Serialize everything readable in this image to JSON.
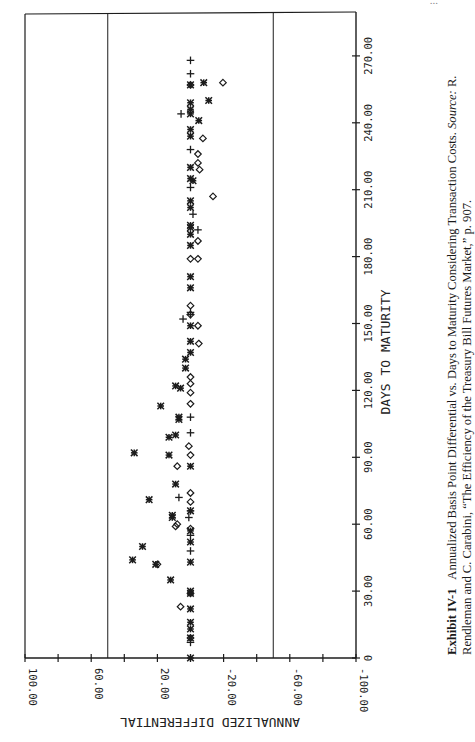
{
  "page": {
    "page_number_fragment": "..."
  },
  "caption": {
    "exhibit_label": "Exhibit IV-1",
    "text_1": "Annualized Basis Point Differential vs. Days to Maturity Considering Transaction Costs. ",
    "source_label": "Source:",
    "text_2": " R. Rendleman and C. Carabini, “The Efficiency of the Treasury Bill Futures Market,” p. 907."
  },
  "chart_data": {
    "type": "scatter",
    "title": "",
    "xlabel": "DAYS TO MATURITY",
    "ylabel": "ANNUALIZED DIFFERENTIAL",
    "xlim": [
      0,
      270
    ],
    "ylim": [
      -100,
      100
    ],
    "orientation": "rotated 90 degrees counter-clockwise on page",
    "x_ticks": [
      0,
      30,
      60,
      90,
      120,
      150,
      180,
      210,
      240,
      270
    ],
    "x_tick_labels": [
      "0",
      "30.00",
      "60.00",
      "90.00",
      "120.00",
      "150.00",
      "180.00",
      "210.00",
      "240.00",
      "270.00"
    ],
    "y_ticks": [
      100,
      80,
      60,
      40,
      20,
      0,
      -20,
      -40,
      -60,
      -80,
      -100
    ],
    "y_tick_labels": [
      "100.00",
      "",
      "60.00",
      "",
      "20.00",
      "",
      "-20.00",
      "",
      "-60.00",
      "",
      "-100.00"
    ],
    "reference_lines_y": [
      50,
      -50
    ],
    "grid": false,
    "legend": null,
    "series": [
      {
        "name": "star",
        "marker": "asterisk",
        "points": [
          [
            0,
            0
          ],
          [
            9,
            0
          ],
          [
            13,
            0
          ],
          [
            16,
            0
          ],
          [
            22,
            0
          ],
          [
            29,
            0
          ],
          [
            30,
            0
          ],
          [
            35,
            12
          ],
          [
            43,
            0
          ],
          [
            44,
            35
          ],
          [
            42,
            21
          ],
          [
            50,
            29
          ],
          [
            52,
            0
          ],
          [
            57,
            0
          ],
          [
            64,
            11
          ],
          [
            66,
            0
          ],
          [
            63,
            11
          ],
          [
            71,
            25
          ],
          [
            78,
            9
          ],
          [
            86,
            0
          ],
          [
            91,
            13
          ],
          [
            92,
            34
          ],
          [
            99,
            13
          ],
          [
            100,
            9
          ],
          [
            107,
            7
          ],
          [
            108,
            7
          ],
          [
            113,
            18
          ],
          [
            121,
            6
          ],
          [
            122,
            9
          ],
          [
            130,
            3
          ],
          [
            134,
            3
          ],
          [
            137,
            0
          ],
          [
            142,
            0
          ],
          [
            149,
            0
          ],
          [
            166,
            0
          ],
          [
            171,
            0
          ],
          [
            185,
            0
          ],
          [
            190,
            0
          ],
          [
            193,
            0
          ],
          [
            194,
            0
          ],
          [
            202,
            0
          ],
          [
            205,
            0
          ],
          [
            214,
            -1.5
          ],
          [
            215,
            0
          ],
          [
            220,
            0
          ],
          [
            234,
            0
          ],
          [
            237,
            0
          ],
          [
            241,
            -5
          ],
          [
            244,
            0
          ],
          [
            246,
            0
          ],
          [
            249,
            0
          ],
          [
            250,
            -11
          ],
          [
            257,
            0
          ],
          [
            258,
            -8
          ]
        ]
      },
      {
        "name": "plus",
        "marker": "plus",
        "points": [
          [
            7,
            0
          ],
          [
            48,
            0
          ],
          [
            55,
            0
          ],
          [
            63,
            1
          ],
          [
            66,
            0
          ],
          [
            72,
            7
          ],
          [
            101,
            0
          ],
          [
            108,
            0
          ],
          [
            152,
            4.5
          ],
          [
            154,
            0
          ],
          [
            155,
            0
          ],
          [
            192,
            -4.5
          ],
          [
            199,
            -1.5
          ],
          [
            211,
            0
          ],
          [
            228,
            0
          ],
          [
            244,
            5.7
          ],
          [
            262,
            0
          ],
          [
            268,
            0
          ]
        ]
      },
      {
        "name": "diamond",
        "marker": "diamond",
        "points": [
          [
            9,
            0
          ],
          [
            23,
            6
          ],
          [
            29,
            0
          ],
          [
            42,
            20
          ],
          [
            58,
            0
          ],
          [
            59,
            9
          ],
          [
            60,
            8
          ],
          [
            70,
            0
          ],
          [
            74,
            0
          ],
          [
            86,
            8
          ],
          [
            91,
            0
          ],
          [
            95,
            1
          ],
          [
            114,
            0
          ],
          [
            119,
            0
          ],
          [
            123,
            0
          ],
          [
            126,
            0
          ],
          [
            141,
            -5
          ],
          [
            149,
            -4.5
          ],
          [
            154,
            0
          ],
          [
            158,
            0
          ],
          [
            179,
            0
          ],
          [
            179,
            -4.5
          ],
          [
            187,
            -4.5
          ],
          [
            207,
            -13.6
          ],
          [
            219,
            -5.5
          ],
          [
            222,
            -4.5
          ],
          [
            226,
            -4.5
          ],
          [
            233,
            -7.5
          ],
          [
            257,
            0
          ],
          [
            258,
            -19.6
          ]
        ]
      }
    ]
  }
}
